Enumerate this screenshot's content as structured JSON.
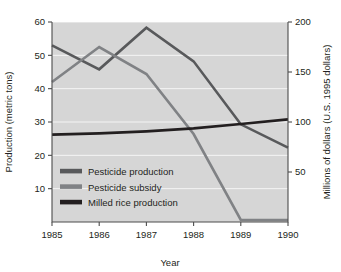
{
  "chart_data": {
    "type": "line",
    "title": "",
    "xlabel": "Year",
    "ylabel": "Production (metric tons)",
    "y2label": "Millions of dollars (U.S. 1995 dollars)",
    "x": [
      1985,
      1986,
      1987,
      1988,
      1989,
      1990
    ],
    "xticklabels": [
      "1985",
      "1986",
      "1987",
      "1988",
      "1989",
      "1990"
    ],
    "xlim": [
      1985,
      1990
    ],
    "ylim": [
      0,
      60
    ],
    "yticks": [
      10,
      20,
      30,
      40,
      50,
      60
    ],
    "yticklabels": [
      "10",
      "20",
      "30",
      "40",
      "50",
      "60"
    ],
    "y2lim": [
      0,
      200
    ],
    "y2ticks": [
      50,
      100,
      150,
      200
    ],
    "y2ticklabels": [
      "50",
      "100",
      "150",
      "200"
    ],
    "grid": true,
    "legend_position": "lower left",
    "series": [
      {
        "name": "Pesticide production",
        "axis": "left",
        "color": "#58595b",
        "width": 2.6,
        "values": [
          53.0,
          45.8,
          58.3,
          48.2,
          29.3,
          22.3
        ]
      },
      {
        "name": "Pesticide subsidy",
        "axis": "right",
        "color": "#808285",
        "width": 2.6,
        "values": [
          140.0,
          175.0,
          148.0,
          88.0,
          2.0,
          2.0
        ]
      },
      {
        "name": "Milled rice production",
        "axis": "left",
        "color": "#231f20",
        "width": 2.6,
        "values": [
          26.2,
          26.6,
          27.2,
          28.1,
          29.4,
          30.8
        ]
      }
    ]
  },
  "legend": {
    "items": [
      {
        "label": "Pesticide production",
        "color": "#58595b"
      },
      {
        "label": "Pesticide subsidy",
        "color": "#808285"
      },
      {
        "label": "Milled rice production",
        "color": "#231f20"
      }
    ]
  },
  "colors": {
    "plot_background": "#d6d6d6",
    "gridline": "#ffffff",
    "axis": "#4d4d4d",
    "text": "#231f20"
  }
}
